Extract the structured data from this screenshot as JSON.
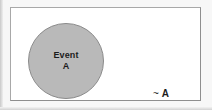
{
  "figure": {
    "name": "venn-diagram-complement",
    "type": "set-diagram",
    "universal_set": {
      "name": "sample-space-rectangle",
      "fill_color": "#ffffff",
      "border_color": "#9a9a9a"
    },
    "circle": {
      "name": "event-a-circle",
      "fill_color": "#b9b9b9",
      "border_color": "#8b8b8b",
      "label_line_1": "Event",
      "label_line_2": "A"
    },
    "complement": {
      "name": "complement-region",
      "symbol": "~",
      "set_name": "A",
      "label": "~ A"
    }
  },
  "chart_data": {
    "type": "diagram",
    "title": "",
    "regions": [
      {
        "label": "Event A",
        "role": "set",
        "shape": "circle",
        "fill": "#b9b9b9"
      },
      {
        "label": "~ A",
        "role": "complement",
        "shape": "rectangle-minus-circle",
        "fill": "#ffffff"
      }
    ],
    "annotations": [
      "Event",
      "A",
      "~ A"
    ]
  }
}
